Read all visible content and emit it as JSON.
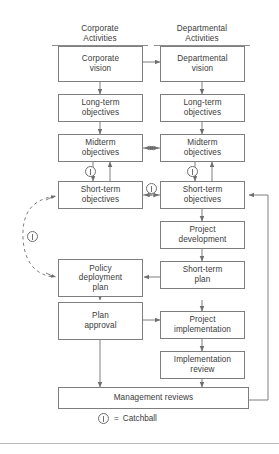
{
  "diagram": {
    "columns": [
      {
        "id": "corporate",
        "line1": "Corporate",
        "line2": "Activities"
      },
      {
        "id": "departmental",
        "line1": "Departmental",
        "line2": "Activities"
      }
    ],
    "corporate_boxes": [
      {
        "id": "corporate-vision",
        "line1": "Corporate",
        "line2": "vision"
      },
      {
        "id": "long-term-objectives",
        "line1": "Long-term",
        "line2": "objectives"
      },
      {
        "id": "midterm-objectives",
        "line1": "Midterm",
        "line2": "objectives"
      },
      {
        "id": "short-term-objectives",
        "line1": "Short-term",
        "line2": "objectives"
      },
      {
        "id": "policy-deployment-plan",
        "line1": "Policy",
        "line2": "deployment",
        "line3": "plan"
      },
      {
        "id": "plan-approval",
        "line1": "Plan",
        "line2": "approval"
      }
    ],
    "departmental_boxes": [
      {
        "id": "departmental-vision",
        "line1": "Departmental",
        "line2": "vision"
      },
      {
        "id": "long-term-objectives",
        "line1": "Long-term",
        "line2": "objectives"
      },
      {
        "id": "midterm-objectives",
        "line1": "Midterm",
        "line2": "objectives"
      },
      {
        "id": "short-term-objectives",
        "line1": "Short-term",
        "line2": "objectives"
      },
      {
        "id": "project-development",
        "line1": "Project",
        "line2": "development"
      },
      {
        "id": "short-term-plan",
        "line1": "Short-term",
        "line2": "plan"
      },
      {
        "id": "project-implementation",
        "line1": "Project",
        "line2": "implementation"
      },
      {
        "id": "implementation-review",
        "line1": "Implementation",
        "line2": "review"
      }
    ],
    "shared_box": {
      "id": "management-reviews",
      "label": "Management reviews"
    },
    "legend": {
      "symbol": "catchball-symbol",
      "equals": "=",
      "label": "Catchball"
    },
    "catchball_marks": [
      {
        "id": "catchball-corporate-mid-short"
      },
      {
        "id": "catchball-departmental-mid-short"
      },
      {
        "id": "catchball-between-short-term"
      },
      {
        "id": "catchball-dashed-loop"
      }
    ],
    "colors": {
      "box_border": "#7e7e7e",
      "line": "#6f6f6f",
      "text": "#3a3a3a",
      "background": "#ffffff",
      "footer_rule": "#b8b8b8"
    }
  }
}
